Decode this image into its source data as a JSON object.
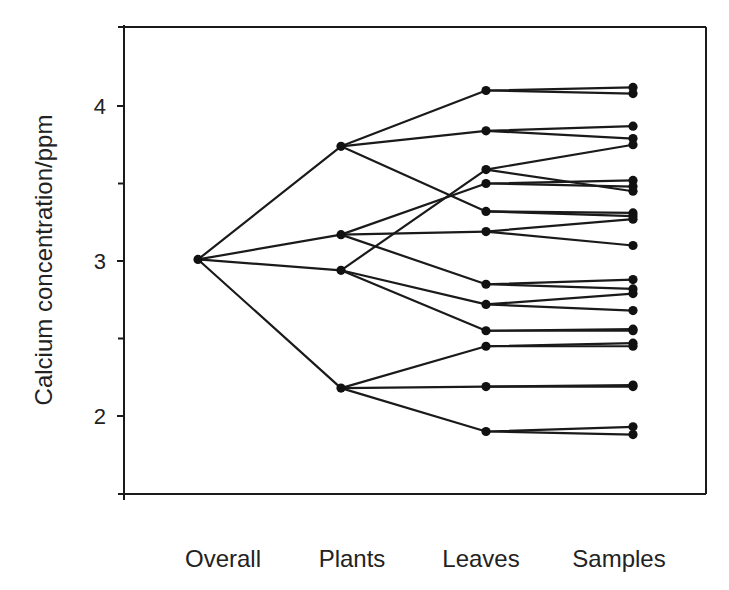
{
  "chart_data": {
    "type": "line",
    "subtype": "nested-hierarchy-tree",
    "title": "",
    "xlabel": "",
    "ylabel": "Calcium concentration/ppm",
    "categories": [
      "Overall",
      "Plants",
      "Leaves",
      "Samples"
    ],
    "ylim": [
      1.5,
      4.5
    ],
    "yticks": [
      2,
      3,
      4
    ],
    "yticks_minor": [
      1.5,
      2.5,
      3.5
    ],
    "ytick_labels": [
      "2",
      "3",
      "4"
    ],
    "grid": false,
    "legend": null,
    "levels": {
      "Overall": [
        3.01
      ],
      "Plants": [
        3.74,
        3.17,
        2.94,
        2.18
      ],
      "Leaves": [
        4.1,
        3.84,
        3.59,
        3.5,
        3.32,
        3.19,
        2.85,
        2.72,
        2.55,
        2.45,
        2.19,
        1.9
      ],
      "Samples": [
        4.12,
        4.08,
        3.87,
        3.79,
        3.75,
        3.45,
        3.52,
        3.48,
        3.31,
        3.29,
        3.27,
        3.1,
        2.88,
        2.82,
        2.79,
        2.68,
        2.56,
        2.55,
        2.47,
        2.45,
        2.2,
        2.19,
        1.93,
        1.88
      ]
    },
    "edges": [
      {
        "from": [
          "Overall",
          0
        ],
        "to": [
          "Plants",
          0
        ]
      },
      {
        "from": [
          "Overall",
          0
        ],
        "to": [
          "Plants",
          1
        ]
      },
      {
        "from": [
          "Overall",
          0
        ],
        "to": [
          "Plants",
          2
        ]
      },
      {
        "from": [
          "Overall",
          0
        ],
        "to": [
          "Plants",
          3
        ]
      },
      {
        "from": [
          "Plants",
          0
        ],
        "to": [
          "Leaves",
          0
        ]
      },
      {
        "from": [
          "Plants",
          0
        ],
        "to": [
          "Leaves",
          1
        ]
      },
      {
        "from": [
          "Plants",
          0
        ],
        "to": [
          "Leaves",
          4
        ]
      },
      {
        "from": [
          "Plants",
          1
        ],
        "to": [
          "Leaves",
          3
        ]
      },
      {
        "from": [
          "Plants",
          1
        ],
        "to": [
          "Leaves",
          5
        ]
      },
      {
        "from": [
          "Plants",
          1
        ],
        "to": [
          "Leaves",
          6
        ]
      },
      {
        "from": [
          "Plants",
          2
        ],
        "to": [
          "Leaves",
          2
        ]
      },
      {
        "from": [
          "Plants",
          2
        ],
        "to": [
          "Leaves",
          7
        ]
      },
      {
        "from": [
          "Plants",
          2
        ],
        "to": [
          "Leaves",
          8
        ]
      },
      {
        "from": [
          "Plants",
          3
        ],
        "to": [
          "Leaves",
          9
        ]
      },
      {
        "from": [
          "Plants",
          3
        ],
        "to": [
          "Leaves",
          10
        ]
      },
      {
        "from": [
          "Plants",
          3
        ],
        "to": [
          "Leaves",
          11
        ]
      },
      {
        "from": [
          "Leaves",
          0
        ],
        "to": [
          "Samples",
          0
        ]
      },
      {
        "from": [
          "Leaves",
          0
        ],
        "to": [
          "Samples",
          1
        ]
      },
      {
        "from": [
          "Leaves",
          1
        ],
        "to": [
          "Samples",
          2
        ]
      },
      {
        "from": [
          "Leaves",
          1
        ],
        "to": [
          "Samples",
          3
        ]
      },
      {
        "from": [
          "Leaves",
          2
        ],
        "to": [
          "Samples",
          4
        ]
      },
      {
        "from": [
          "Leaves",
          2
        ],
        "to": [
          "Samples",
          5
        ]
      },
      {
        "from": [
          "Leaves",
          3
        ],
        "to": [
          "Samples",
          6
        ]
      },
      {
        "from": [
          "Leaves",
          3
        ],
        "to": [
          "Samples",
          7
        ]
      },
      {
        "from": [
          "Leaves",
          4
        ],
        "to": [
          "Samples",
          8
        ]
      },
      {
        "from": [
          "Leaves",
          4
        ],
        "to": [
          "Samples",
          9
        ]
      },
      {
        "from": [
          "Leaves",
          5
        ],
        "to": [
          "Samples",
          10
        ]
      },
      {
        "from": [
          "Leaves",
          5
        ],
        "to": [
          "Samples",
          11
        ]
      },
      {
        "from": [
          "Leaves",
          6
        ],
        "to": [
          "Samples",
          12
        ]
      },
      {
        "from": [
          "Leaves",
          6
        ],
        "to": [
          "Samples",
          13
        ]
      },
      {
        "from": [
          "Leaves",
          7
        ],
        "to": [
          "Samples",
          14
        ]
      },
      {
        "from": [
          "Leaves",
          7
        ],
        "to": [
          "Samples",
          15
        ]
      },
      {
        "from": [
          "Leaves",
          8
        ],
        "to": [
          "Samples",
          16
        ]
      },
      {
        "from": [
          "Leaves",
          8
        ],
        "to": [
          "Samples",
          17
        ]
      },
      {
        "from": [
          "Leaves",
          9
        ],
        "to": [
          "Samples",
          18
        ]
      },
      {
        "from": [
          "Leaves",
          9
        ],
        "to": [
          "Samples",
          19
        ]
      },
      {
        "from": [
          "Leaves",
          10
        ],
        "to": [
          "Samples",
          20
        ]
      },
      {
        "from": [
          "Leaves",
          10
        ],
        "to": [
          "Samples",
          21
        ]
      },
      {
        "from": [
          "Leaves",
          11
        ],
        "to": [
          "Samples",
          22
        ]
      },
      {
        "from": [
          "Leaves",
          11
        ],
        "to": [
          "Samples",
          23
        ]
      }
    ],
    "colors": {
      "line": "#1a1a1a",
      "marker": "#111111",
      "axis": "#1a1a1a",
      "background": "#ffffff"
    }
  }
}
